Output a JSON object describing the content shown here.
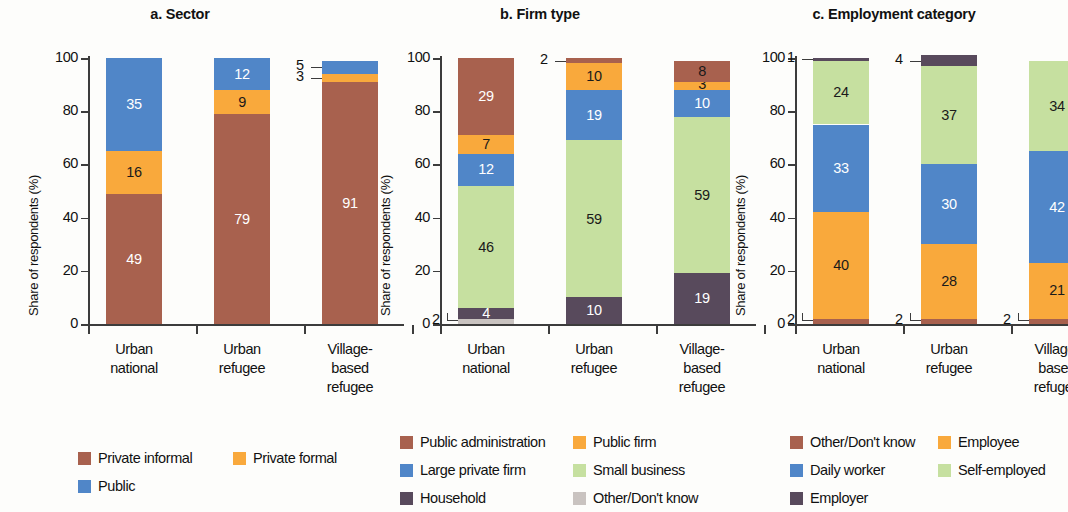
{
  "figure": {
    "ylabel": "Share of respondents (%)",
    "y_ticks": [
      "0",
      "20",
      "40",
      "60",
      "80",
      "100"
    ],
    "categories": [
      "Urban\nnational",
      "Urban\nrefugee",
      "Village-\nbased\nrefugee"
    ]
  },
  "colors": {
    "brown": "#A8614E",
    "orange": "#F9A93C",
    "blue": "#5086C8",
    "green": "#C6E0A0",
    "purple": "#584A5C",
    "grey": "#C9C3C0"
  },
  "panels": [
    {
      "key": "sector",
      "title": "a. Sector",
      "legend": [
        {
          "label": "Private informal",
          "color": "#A8614E"
        },
        {
          "label": "Private formal",
          "color": "#F9A93C"
        },
        {
          "label": "Public",
          "color": "#5086C8"
        }
      ]
    },
    {
      "key": "firm_type",
      "title": "b. Firm type",
      "legend": [
        {
          "label": "Public administration",
          "color": "#A8614E"
        },
        {
          "label": "Public firm",
          "color": "#F9A93C"
        },
        {
          "label": "Large private firm",
          "color": "#5086C8"
        },
        {
          "label": "Small business",
          "color": "#C6E0A0"
        },
        {
          "label": "Household",
          "color": "#584A5C"
        },
        {
          "label": "Other/Don't know",
          "color": "#C9C3C0"
        }
      ]
    },
    {
      "key": "employment_category",
      "title": "c. Employment category",
      "legend": [
        {
          "label": "Other/Don't know",
          "color": "#A8614E"
        },
        {
          "label": "Employee",
          "color": "#F9A93C"
        },
        {
          "label": "Daily worker",
          "color": "#5086C8"
        },
        {
          "label": "Self-employed",
          "color": "#C6E0A0"
        },
        {
          "label": "Employer",
          "color": "#584A5C"
        }
      ]
    }
  ],
  "chart_data": [
    {
      "type": "bar",
      "stacked": true,
      "title": "a. Sector",
      "xlabel": "",
      "ylabel": "Share of respondents (%)",
      "ylim": [
        0,
        100
      ],
      "yticks": [
        0,
        20,
        40,
        60,
        80,
        100
      ],
      "grid": false,
      "legend_position": "below",
      "categories": [
        "Urban national",
        "Urban refugee",
        "Village-based refugee"
      ],
      "series": [
        {
          "name": "Private informal",
          "color": "#A8614E",
          "values": [
            49,
            79,
            91
          ]
        },
        {
          "name": "Private formal",
          "color": "#F9A93C",
          "values": [
            16,
            9,
            3
          ]
        },
        {
          "name": "Public",
          "color": "#5086C8",
          "values": [
            35,
            12,
            5
          ]
        }
      ]
    },
    {
      "type": "bar",
      "stacked": true,
      "title": "b. Firm type",
      "xlabel": "",
      "ylabel": "Share of respondents (%)",
      "ylim": [
        0,
        100
      ],
      "yticks": [
        0,
        20,
        40,
        60,
        80,
        100
      ],
      "grid": false,
      "legend_position": "below",
      "categories": [
        "Urban national",
        "Urban refugee",
        "Village-based refugee"
      ],
      "series": [
        {
          "name": "Other/Don't know",
          "color": "#C9C3C0",
          "values": [
            2,
            0,
            0
          ]
        },
        {
          "name": "Household",
          "color": "#584A5C",
          "values": [
            4,
            10,
            19
          ]
        },
        {
          "name": "Small business",
          "color": "#C6E0A0",
          "values": [
            46,
            59,
            59
          ]
        },
        {
          "name": "Large private firm",
          "color": "#5086C8",
          "values": [
            12,
            19,
            10
          ]
        },
        {
          "name": "Public firm",
          "color": "#F9A93C",
          "values": [
            7,
            10,
            3
          ]
        },
        {
          "name": "Public administration",
          "color": "#A8614E",
          "values": [
            29,
            2,
            8
          ]
        }
      ]
    },
    {
      "type": "bar",
      "stacked": true,
      "title": "c. Employment category",
      "xlabel": "",
      "ylabel": "Share of respondents (%)",
      "ylim": [
        0,
        100
      ],
      "yticks": [
        0,
        20,
        40,
        60,
        80,
        100
      ],
      "grid": false,
      "legend_position": "below",
      "categories": [
        "Urban national",
        "Urban refugee",
        "Village-based refugee"
      ],
      "series": [
        {
          "name": "Other/Don't know",
          "color": "#A8614E",
          "values": [
            2,
            2,
            2
          ]
        },
        {
          "name": "Employee",
          "color": "#F9A93C",
          "values": [
            40,
            28,
            21
          ]
        },
        {
          "name": "Daily worker",
          "color": "#5086C8",
          "values": [
            33,
            30,
            42
          ]
        },
        {
          "name": "Self-employed",
          "color": "#C6E0A0",
          "values": [
            24,
            37,
            34
          ]
        },
        {
          "name": "Employer",
          "color": "#584A5C",
          "values": [
            1,
            4,
            0
          ]
        }
      ]
    }
  ],
  "labels": {
    "panel_a": {
      "bar1": [
        {
          "text": "49",
          "inside": true,
          "color": "#ffffff"
        },
        {
          "text": "16",
          "inside": true,
          "color": "#1a1a1a"
        },
        {
          "text": "35",
          "inside": true,
          "color": "#ffffff"
        }
      ],
      "bar2": [
        {
          "text": "79",
          "inside": true,
          "color": "#ffffff"
        },
        {
          "text": "9",
          "inside": true,
          "color": "#1a1a1a"
        },
        {
          "text": "12",
          "inside": true,
          "color": "#ffffff"
        }
      ],
      "bar3": [
        {
          "text": "91",
          "inside": true,
          "color": "#ffffff"
        },
        {
          "text": "3",
          "inside": false,
          "color": "#1a1a1a"
        },
        {
          "text": "5",
          "inside": false,
          "color": "#ffffff"
        }
      ]
    },
    "panel_b": {
      "bar1": [
        {
          "text": "2",
          "inside": false,
          "color": "#1a1a1a"
        },
        {
          "text": "4",
          "inside": true,
          "color": "#ffffff"
        },
        {
          "text": "46",
          "inside": true,
          "color": "#1a1a1a"
        },
        {
          "text": "12",
          "inside": true,
          "color": "#ffffff"
        },
        {
          "text": "7",
          "inside": true,
          "color": "#1a1a1a"
        },
        {
          "text": "29",
          "inside": true,
          "color": "#ffffff"
        }
      ],
      "bar2": [
        {
          "text": "10",
          "inside": true,
          "color": "#ffffff"
        },
        {
          "text": "59",
          "inside": true,
          "color": "#1a1a1a"
        },
        {
          "text": "19",
          "inside": true,
          "color": "#ffffff"
        },
        {
          "text": "10",
          "inside": true,
          "color": "#1a1a1a"
        },
        {
          "text": "2",
          "inside": false,
          "color": "#1a1a1a"
        }
      ],
      "bar3": [
        {
          "text": "19",
          "inside": true,
          "color": "#ffffff"
        },
        {
          "text": "59",
          "inside": true,
          "color": "#1a1a1a"
        },
        {
          "text": "10",
          "inside": true,
          "color": "#ffffff"
        },
        {
          "text": "3",
          "inside": true,
          "color": "#1a1a1a"
        },
        {
          "text": "8",
          "inside": true,
          "color": "#1a1a1a"
        }
      ]
    },
    "panel_c": {
      "bar1": [
        {
          "text": "2",
          "inside": false,
          "color": "#1a1a1a"
        },
        {
          "text": "40",
          "inside": true,
          "color": "#1a1a1a"
        },
        {
          "text": "33",
          "inside": true,
          "color": "#ffffff"
        },
        {
          "text": "24",
          "inside": true,
          "color": "#1a1a1a"
        },
        {
          "text": "1",
          "inside": false,
          "color": "#1a1a1a"
        }
      ],
      "bar2": [
        {
          "text": "2",
          "inside": false,
          "color": "#1a1a1a"
        },
        {
          "text": "28",
          "inside": true,
          "color": "#1a1a1a"
        },
        {
          "text": "30",
          "inside": true,
          "color": "#ffffff"
        },
        {
          "text": "37",
          "inside": true,
          "color": "#1a1a1a"
        },
        {
          "text": "4",
          "inside": false,
          "color": "#1a1a1a"
        }
      ],
      "bar3": [
        {
          "text": "2",
          "inside": false,
          "color": "#1a1a1a"
        },
        {
          "text": "21",
          "inside": true,
          "color": "#1a1a1a"
        },
        {
          "text": "42",
          "inside": true,
          "color": "#ffffff"
        },
        {
          "text": "34",
          "inside": true,
          "color": "#1a1a1a"
        }
      ]
    }
  }
}
